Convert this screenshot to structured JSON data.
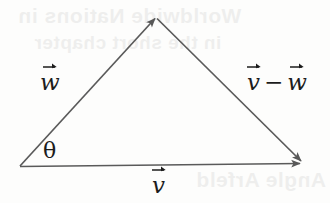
{
  "figure": {
    "background_color": "#fdfdfc",
    "stroke_color": "#5a5a5a",
    "label_color": "#1c1c1c",
    "width": 330,
    "height": 203
  },
  "labels": {
    "w": "w",
    "v_minus_w_first": "v",
    "v_minus_w_operator": "−",
    "v_minus_w_second": "w",
    "v": "v",
    "theta": "θ"
  },
  "bleed_through": {
    "line1": "Worldwide Nations in",
    "line2": "in the short chapter",
    "line3": "Angle Arfeld"
  },
  "geometry": {
    "origin": {
      "x": 20,
      "y": 166
    },
    "apex": {
      "x": 156,
      "y": 17
    },
    "right": {
      "x": 302,
      "y": 163
    },
    "vectors": [
      {
        "name": "w",
        "from": "origin",
        "to": "apex",
        "arrowhead_at": "apex"
      },
      {
        "name": "v-minus-w",
        "from": "apex",
        "to": "right",
        "arrowhead_at": "right"
      },
      {
        "name": "v",
        "from": "origin",
        "to": "right",
        "arrowhead_at": "right"
      }
    ],
    "angle_marked_at": "origin"
  }
}
